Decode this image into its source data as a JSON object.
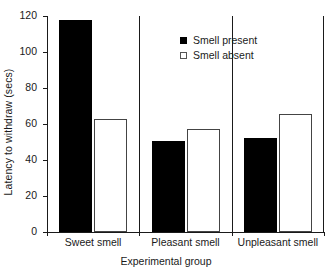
{
  "chart_data": {
    "type": "bar",
    "title": "",
    "xlabel": "Experimental group",
    "ylabel": "Latency to withdraw (secs)",
    "categories": [
      "Sweet smell",
      "Pleasant smell",
      "Unpleasant smell"
    ],
    "series": [
      {
        "name": "Smell present",
        "color": "#000000",
        "style": "filled",
        "values": [
          118,
          50.5,
          52
        ]
      },
      {
        "name": "Smell absent",
        "color": "#ffffff",
        "style": "open",
        "values": [
          63,
          57,
          65.5
        ]
      }
    ],
    "ylim": [
      0,
      120
    ],
    "ytick_values": [
      0,
      20,
      40,
      60,
      80,
      100,
      120
    ],
    "ytick_labels": [
      "0",
      "20",
      "40",
      "60",
      "80",
      "100",
      "120"
    ],
    "grid": false,
    "legend_position": "top-center-right",
    "group_separators": true
  },
  "legend": {
    "items": [
      {
        "label": "Smell present",
        "style": "filled"
      },
      {
        "label": "Smell absent",
        "style": "open"
      }
    ]
  },
  "axes": {
    "y_title": "Latency to withdraw (secs)",
    "x_title": "Experimental group"
  }
}
